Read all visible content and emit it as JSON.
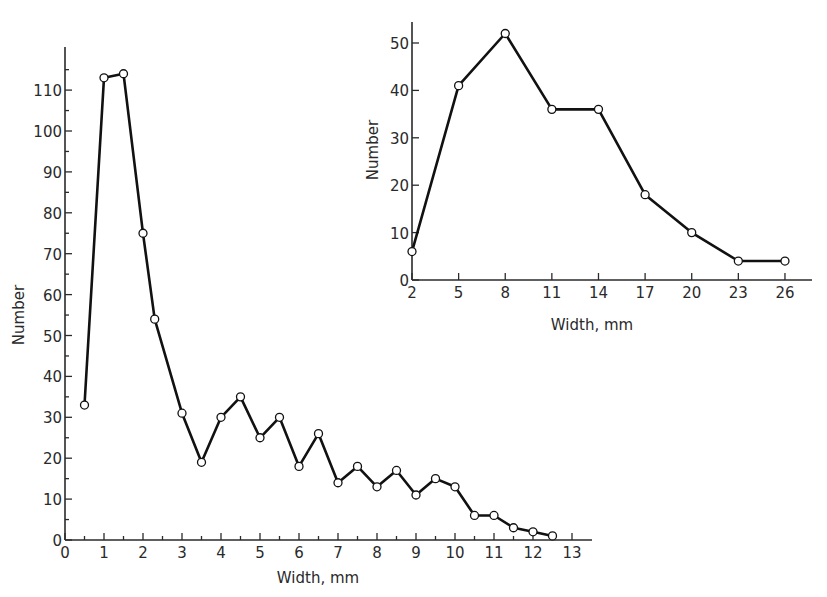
{
  "chart_data": [
    {
      "id": "main",
      "type": "line",
      "title": "",
      "xlabel": "Width, mm",
      "ylabel": "Number",
      "xlim": [
        0,
        13.5
      ],
      "ylim": [
        0,
        118
      ],
      "grid": false,
      "legend": null,
      "marker": "open-circle",
      "x_ticks": [
        0,
        1,
        2,
        3,
        4,
        5,
        6,
        7,
        8,
        9,
        10,
        11,
        12,
        13
      ],
      "x_minor_ticks_step": 0.5,
      "y_ticks": [
        0,
        10,
        20,
        30,
        40,
        50,
        60,
        70,
        80,
        90,
        100,
        110
      ],
      "y_minor_ticks_step": 5,
      "x": [
        0.5,
        1.0,
        1.5,
        2.0,
        2.3,
        3.0,
        3.5,
        4.0,
        4.5,
        5.0,
        5.5,
        6.0,
        6.5,
        7.0,
        7.5,
        8.0,
        8.5,
        9.0,
        9.5,
        10.0,
        10.5,
        11.0,
        11.5,
        12.0,
        12.5
      ],
      "series": [
        {
          "name": "Number",
          "values": [
            33,
            113,
            114,
            75,
            54,
            31,
            19,
            30,
            35,
            25,
            30,
            18,
            26,
            14,
            18,
            13,
            17,
            11,
            15,
            13,
            6,
            6,
            3,
            2,
            1
          ]
        }
      ]
    },
    {
      "id": "inset",
      "type": "line",
      "title": "",
      "xlabel": "Width, mm",
      "ylabel": "Number",
      "xlim": [
        2,
        28
      ],
      "ylim": [
        0,
        54
      ],
      "grid": false,
      "legend": null,
      "marker": "open-circle",
      "x_ticks": [
        2,
        5,
        8,
        11,
        14,
        17,
        20,
        23,
        26
      ],
      "y_ticks": [
        0,
        10,
        20,
        30,
        40,
        50
      ],
      "x": [
        2,
        5,
        8,
        11,
        14,
        17,
        20,
        23,
        26
      ],
      "series": [
        {
          "name": "Number",
          "values": [
            6,
            41,
            52,
            36,
            36,
            18,
            10,
            4,
            4
          ]
        }
      ]
    }
  ],
  "main": {
    "xlabel": "Width, mm",
    "ylabel": "Number",
    "x_tick_labels": [
      "0",
      "1",
      "2",
      "3",
      "4",
      "5",
      "6",
      "7",
      "8",
      "9",
      "10",
      "11",
      "12",
      "13"
    ],
    "y_tick_labels": [
      "0",
      "10",
      "20",
      "30",
      "40",
      "50",
      "60",
      "70",
      "80",
      "90",
      "100",
      "110"
    ]
  },
  "inset": {
    "xlabel": "Width, mm",
    "ylabel": "Number",
    "x_tick_labels": [
      "2",
      "5",
      "8",
      "11",
      "14",
      "17",
      "20",
      "23",
      "26"
    ],
    "y_tick_labels": [
      "0",
      "10",
      "20",
      "30",
      "40",
      "50"
    ]
  },
  "colors": {
    "line": "#111111",
    "axis": "#2a2a2a",
    "marker_fill": "#ffffff",
    "background": "#ffffff"
  }
}
